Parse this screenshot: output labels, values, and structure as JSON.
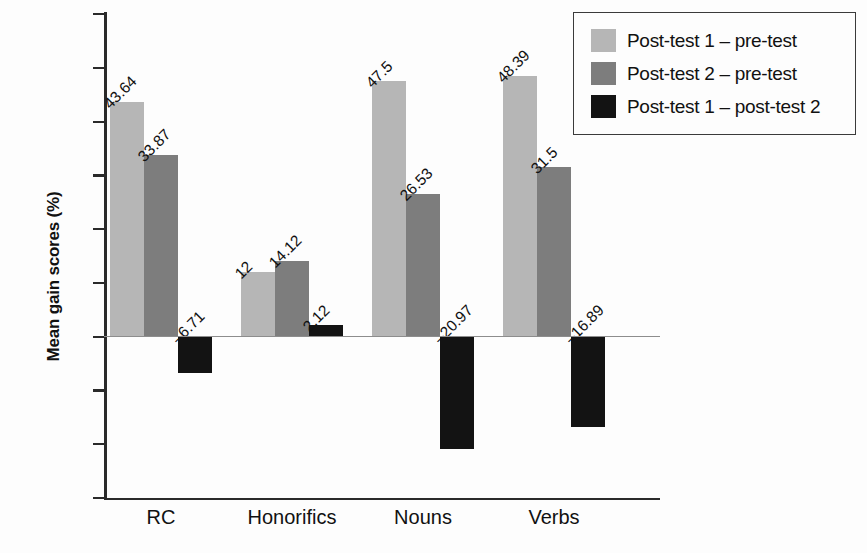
{
  "chart_data": {
    "type": "bar",
    "title": "",
    "subtitle": "",
    "xlabel": "",
    "ylabel": "Mean gain scores (%)",
    "categories": [
      "RC",
      "Honorifics",
      "Nouns",
      "Verbs"
    ],
    "series": [
      {
        "name": "Post-test 1 – pre-test",
        "color": "#b6b6b6",
        "values": [
          43.64,
          12,
          47.5,
          48.39
        ],
        "labels": [
          "43.64",
          "12",
          "47.5",
          "48.39"
        ]
      },
      {
        "name": "Post-test 2 – pre-test",
        "color": "#7d7d7d",
        "values": [
          33.87,
          14.12,
          26.53,
          31.5
        ],
        "labels": [
          "33.87",
          "14.12",
          "26.53",
          "31.5"
        ]
      },
      {
        "name": "Post-test 1 – post-test 2",
        "color": "#131313",
        "values": [
          -6.71,
          2.12,
          -20.97,
          -16.89
        ],
        "labels": [
          "–6.71",
          "2.12",
          "–20.97",
          "–16.89"
        ]
      }
    ],
    "ylim": [
      -30,
      60
    ],
    "ytick_step": 10,
    "ytick_labels": [
      "60",
      "50",
      "40",
      "30",
      "20",
      "10",
      "0",
      "–10",
      "–20",
      "–30"
    ],
    "ytick_values": [
      60,
      50,
      40,
      30,
      20,
      10,
      0,
      -10,
      -20,
      -30
    ],
    "grid": false,
    "legend_position": "top-right",
    "value_labels_rotation": -45,
    "axis_color": "#2a2a2a"
  },
  "legend": {
    "entries": [
      {
        "label": "Post-test 1 – pre-test",
        "swatch": "light-gray-swatch"
      },
      {
        "label": "Post-test 2 – pre-test",
        "swatch": "medium-gray-swatch"
      },
      {
        "label": "Post-test 1 – post-test 2",
        "swatch": "black-swatch"
      }
    ]
  }
}
